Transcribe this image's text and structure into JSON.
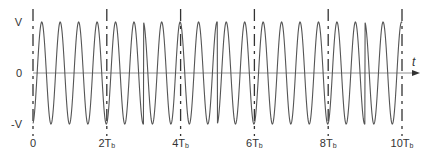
{
  "figure": {
    "y_axis_labels": {
      "top": "V",
      "zero": "0",
      "bottom": "-V"
    },
    "x_axis_label": "t",
    "x_ticks": [
      {
        "main": "0",
        "sub": ""
      },
      {
        "main": "2T",
        "sub": "b"
      },
      {
        "main": "4T",
        "sub": "b"
      },
      {
        "main": "6T",
        "sub": "b"
      },
      {
        "main": "8T",
        "sub": "b"
      },
      {
        "main": "10T",
        "sub": "b"
      }
    ],
    "colors": {
      "waveform": "#555555",
      "axis": "#777777",
      "marker": "#333333",
      "text": "#333333"
    }
  },
  "chart_data": {
    "type": "line",
    "title": "",
    "xlabel": "t",
    "ylabel": "",
    "x_ticks": [
      "0",
      "2Tb",
      "4Tb",
      "6Tb",
      "8Tb",
      "10Tb"
    ],
    "y_ticks": [
      "-V",
      "0",
      "V"
    ],
    "ylim": [
      -1,
      1
    ],
    "xlim": [
      0,
      10
    ],
    "x_unit": "Tb",
    "carrier_cycles_per_Tb": 2,
    "amplitude": 1,
    "phase_reversal_times_Tb": [
      3.0,
      5.0,
      9.0
    ],
    "markers_dashed_at_Tb": [
      0,
      2,
      4,
      6,
      8,
      10
    ],
    "grid": false,
    "legend": null
  }
}
